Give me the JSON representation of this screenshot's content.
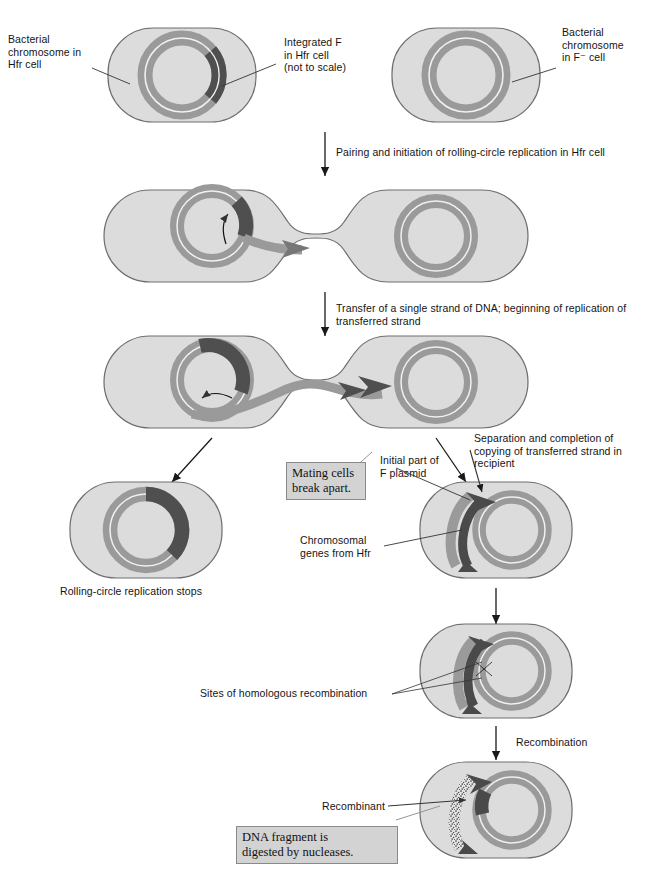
{
  "figure": {
    "colors": {
      "cell_fill": "#dcdcdc",
      "cell_stroke": "#6e6e6e",
      "chromosome": "#9a9a9a",
      "chromosome_inner_line": "#f2f2f2",
      "f_plasmid_dark": "#4a4a4a",
      "transferred_strand": "#8f8f8f",
      "callout_bg": "#d3d3d3",
      "callout_border": "#8a8a8a",
      "leader_line": "#333333",
      "arrow": "#1a1a1a"
    }
  },
  "labels": {
    "bacterial_chromosome_hfr": "Bacterial\nchromosome in\nHfr cell",
    "integrated_f": "Integrated F\nin Hfr cell\n(not to scale)",
    "bacterial_chromosome_fminus": "Bacterial\nchromosome\nin F⁻ cell",
    "step_pairing": "Pairing and initiation of rolling-circle replication in Hfr cell",
    "step_transfer": "Transfer of a single strand of DNA; beginning of replication of\ntransferred strand",
    "step_separation": "Separation and completion of\ncopying of transferred strand in\nrecipient",
    "rolling_circle_stops": "Rolling-circle replication stops",
    "initial_part_f_plasmid": "Initial part of\nF plasmid",
    "chromosomal_genes_hfr": "Chromosomal\ngenes from Hfr",
    "sites_homologous_recombination": "Sites of homologous recombination",
    "step_recombination": "Recombination",
    "recombinant": "Recombinant"
  },
  "callouts": {
    "mating_cells": "Mating cells\nbreak apart.",
    "dna_digested": "DNA fragment is\ndigested by nucleases."
  }
}
